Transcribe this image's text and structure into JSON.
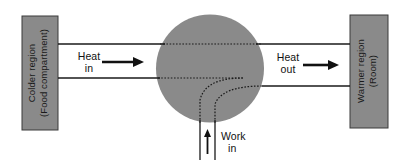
{
  "diagram": {
    "colors": {
      "fill_gray": "#8a8a8a",
      "stroke_dark": "#1a1a1a",
      "text_dark": "#111111",
      "background": "#ffffff"
    },
    "cold_reservoir": {
      "name": "colder-region-box",
      "line1": "Colder region",
      "line2": "(Food compartment)"
    },
    "hot_reservoir": {
      "name": "warmer-region-box",
      "line1": "Warmer region",
      "line2": "(Room)"
    },
    "device": {
      "name": "heat-pump-circle",
      "label": ""
    },
    "heat_in": {
      "line1": "Heat",
      "line2": "in",
      "arrow": "right-arrow-icon"
    },
    "heat_out": {
      "line1": "Heat",
      "line2": "out",
      "arrow": "right-arrow-icon"
    },
    "work_in": {
      "line1": "Work",
      "line2": "in",
      "arrow": "up-arrow-icon"
    }
  }
}
